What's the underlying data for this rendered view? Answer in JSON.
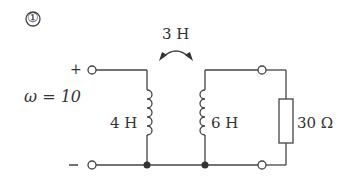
{
  "problem": {
    "number_label": "①"
  },
  "source": {
    "frequency_label": "ω = 10",
    "plus_label": "+",
    "minus_label": "−"
  },
  "mutual_inductance": {
    "label": "3 H"
  },
  "components": [
    {
      "type": "inductor",
      "label": "4 H",
      "position": "primary"
    },
    {
      "type": "inductor",
      "label": "6 H",
      "position": "secondary"
    },
    {
      "type": "resistor",
      "label": "30 Ω",
      "position": "load"
    }
  ],
  "colors": {
    "wire": "#444444",
    "text": "#333333",
    "background": "#ffffff"
  }
}
